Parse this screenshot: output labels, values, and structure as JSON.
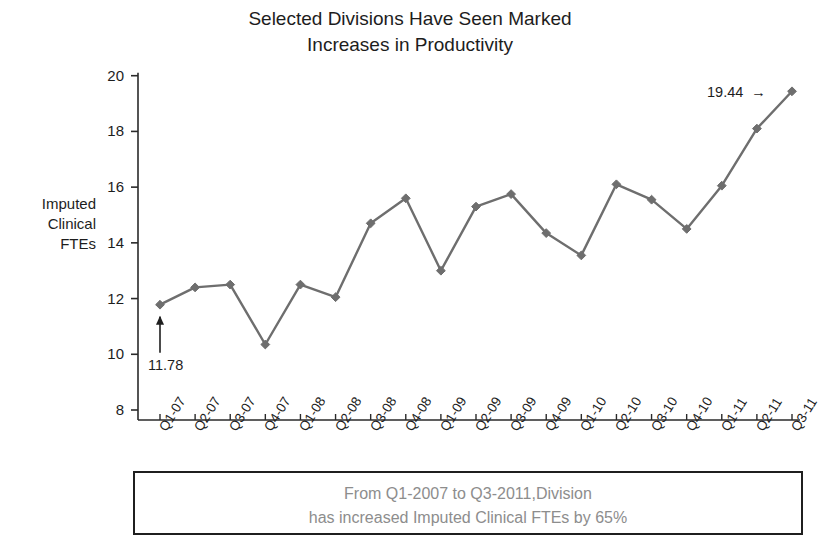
{
  "chart_data": {
    "type": "line",
    "title": "Selected Divisions Have Seen Marked\nIncreases in Productivity",
    "xlabel": "",
    "ylabel": "Imputed\nClinical\nFTEs",
    "ylim": [
      8,
      20
    ],
    "ytick_step": 2,
    "yticks": [
      "8",
      "10",
      "12",
      "14",
      "16",
      "18",
      "20"
    ],
    "grid": false,
    "legend": false,
    "series_color": "#6e6e6e",
    "marker": "diamond",
    "categories": [
      "Q1-07",
      "Q2-07",
      "Q3-07",
      "Q4-07",
      "Q1-08",
      "Q2-08",
      "Q3-08",
      "Q4-08",
      "Q1-09",
      "Q2-09",
      "Q3-09",
      "Q4-09",
      "Q1-10",
      "Q2-10",
      "Q3-10",
      "Q4-10",
      "Q1-11",
      "Q2-11",
      "Q3-11"
    ],
    "values": [
      11.78,
      12.4,
      12.5,
      10.35,
      12.5,
      12.05,
      14.7,
      15.6,
      13.0,
      15.3,
      15.75,
      14.35,
      13.55,
      16.1,
      15.55,
      14.5,
      16.05,
      18.1,
      19.44
    ]
  },
  "annotations": {
    "first_point_value": "11.78",
    "last_point_value": "19.44",
    "last_point_arrow": "→"
  },
  "caption": {
    "text": "From Q1-2007 to Q3-2011,Division\nhas increased Imputed Clinical FTEs by 65%"
  }
}
